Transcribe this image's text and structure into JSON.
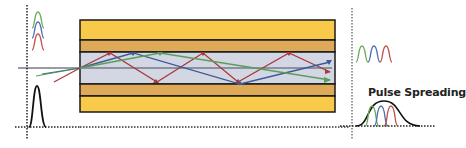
{
  "diagram": {
    "output_label": "Pulse Spreading",
    "colors": {
      "cladding_outer": "#f9c949",
      "cladding_inner": "#deaa58",
      "core": "#d3d6e3",
      "border": "#1a1a1a",
      "axis": "#777a8a",
      "ray_red": "#a63a3a",
      "ray_blue": "#3c5b96",
      "ray_green": "#5a9e5a",
      "pulse_black": "#111111",
      "pulse_red": "#c0504d",
      "pulse_blue": "#4f6fb0",
      "pulse_green": "#6aab5a"
    },
    "input_pulses": [
      "green",
      "blue",
      "red"
    ],
    "output_pulses": [
      "green",
      "blue",
      "red"
    ],
    "rays": [
      "red",
      "blue",
      "green",
      "axial"
    ]
  }
}
